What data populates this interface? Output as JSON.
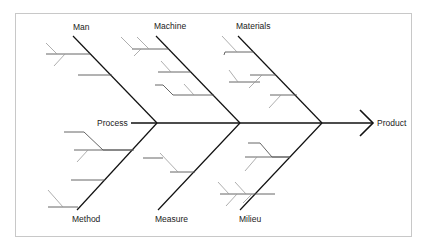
{
  "diagram": {
    "type": "fishbone",
    "effect": "Product",
    "categories": {
      "top": [
        "Man",
        "Machine",
        "Materials"
      ],
      "bottom": [
        "Method",
        "Measure",
        "Milieu"
      ]
    },
    "spine_label": "Process",
    "colors": {
      "primary_line": "#111111",
      "sub_line": "#555555",
      "minor_line": "#999999",
      "frame": "#c8c8c8"
    }
  }
}
